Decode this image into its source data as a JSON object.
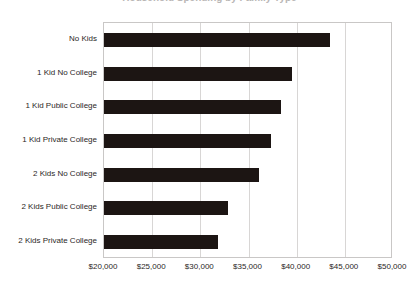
{
  "title": {
    "text": "Household Spending by Family Type",
    "visible_fragment": true
  },
  "chart_data": {
    "type": "bar",
    "orientation": "horizontal",
    "title": "Household Spending by Family Type",
    "xlabel": "",
    "ylabel": "",
    "categories": [
      "No Kids",
      "1 Kid No College",
      "1 Kid Public College",
      "1 Kid Private College",
      "2 Kids No College",
      "2 Kids Public College",
      "2 Kids Private College"
    ],
    "values": [
      43470,
      39520,
      38380,
      37340,
      36090,
      32870,
      31840
    ],
    "xlim": [
      20000,
      50000
    ],
    "xticks": [
      20000,
      25000,
      30000,
      35000,
      40000,
      45000,
      50000
    ],
    "xticklabels": [
      "$20,000",
      "$25,000",
      "$30,000",
      "$35,000",
      "$40,000",
      "$45,000",
      "$50,000"
    ],
    "grid": true,
    "legend": false,
    "bar_color": "#1c1513",
    "gridline_color": "#d8d6d5",
    "axis_color": "#c9c7c6"
  }
}
